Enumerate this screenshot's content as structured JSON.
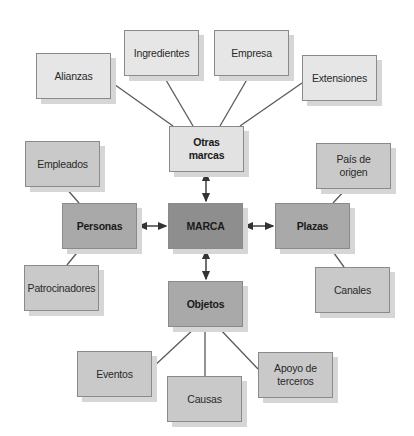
{
  "diagram": {
    "center": "MARCA",
    "primary": {
      "top": "Otras\nmarcas",
      "left": "Personas",
      "right": "Plazas",
      "bottom": "Objetos"
    },
    "otras_marcas": [
      "Alianzas",
      "Ingredientes",
      "Empresa",
      "Extensiones"
    ],
    "personas": [
      "Empleados",
      "Patrocinadores"
    ],
    "plazas": [
      "País de\norigen",
      "Canales"
    ],
    "objetos": [
      "Eventos",
      "Causas",
      "Apoyo de\nterceros"
    ]
  },
  "colors": {
    "center_fill": "#8e8e8e",
    "primary_fill": "#a9a9a9",
    "otras_marcas_fill": "#e2e2e2",
    "secondary_fill": "#c9c9c9",
    "tertiary_fill": "#e6e6e6",
    "line": "#555555"
  }
}
